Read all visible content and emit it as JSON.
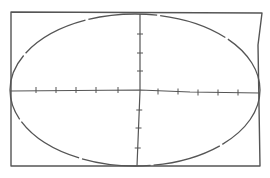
{
  "diagram": {
    "type": "hand-drawn ellipse in rectangle with axes",
    "stroke_color": "#555555",
    "background": "#ffffff",
    "frame": {
      "points": [
        [
          11,
          12
        ],
        [
          262,
          13
        ],
        [
          258,
          45
        ],
        [
          260,
          166
        ],
        [
          11,
          166
        ]
      ]
    },
    "ellipse": {
      "cx": 135,
      "cy": 90,
      "rx": 125,
      "ry": 76
    },
    "horizontal_axis": {
      "y": 91,
      "x_start": 10,
      "x_end": 260,
      "ticks_x": [
        36,
        56,
        76,
        96,
        118,
        158,
        178,
        198,
        218,
        238
      ]
    },
    "vertical_axis": {
      "x": 140,
      "y_start": 14,
      "y_end": 166,
      "ticks_y": [
        34,
        53,
        71,
        110,
        128,
        148
      ]
    }
  }
}
